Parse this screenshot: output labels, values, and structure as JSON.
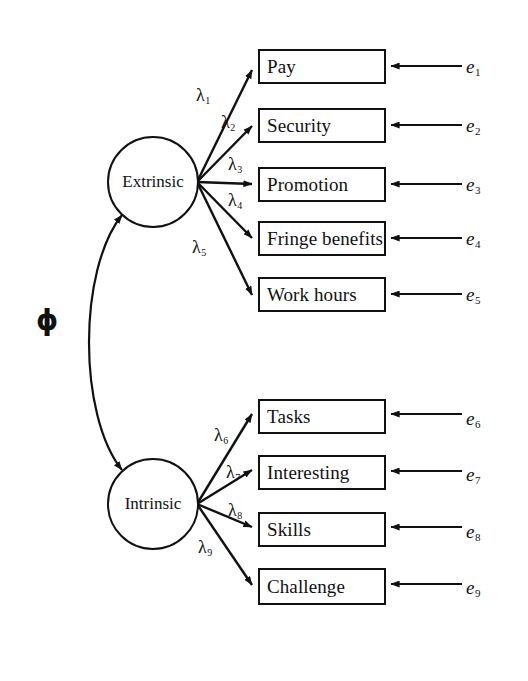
{
  "diagram": {
    "type": "sem-path-diagram",
    "background_color": "#ffffff",
    "stroke_color": "#111111",
    "latent_factors": [
      {
        "id": "extrinsic",
        "label": "Extrinsic",
        "cx": 153,
        "cy": 182,
        "r": 46
      },
      {
        "id": "intrinsic",
        "label": "Intrinsic",
        "cx": 153,
        "cy": 504,
        "r": 46
      }
    ],
    "indicators": [
      {
        "id": "pay",
        "label": "Pay",
        "x": 258,
        "y": 49,
        "w": 128,
        "h": 35,
        "factor": "extrinsic"
      },
      {
        "id": "security",
        "label": "Security",
        "x": 258,
        "y": 108,
        "w": 128,
        "h": 35,
        "factor": "extrinsic"
      },
      {
        "id": "promotion",
        "label": "Promotion",
        "x": 258,
        "y": 167,
        "w": 128,
        "h": 35,
        "factor": "extrinsic"
      },
      {
        "id": "fringe-benefits",
        "label": "Fringe benefits",
        "x": 258,
        "y": 221,
        "w": 128,
        "h": 35,
        "factor": "extrinsic"
      },
      {
        "id": "work-hours",
        "label": "Work hours",
        "x": 258,
        "y": 277,
        "w": 128,
        "h": 35,
        "factor": "extrinsic"
      },
      {
        "id": "tasks",
        "label": "Tasks",
        "x": 258,
        "y": 399,
        "w": 128,
        "h": 35,
        "factor": "intrinsic"
      },
      {
        "id": "interesting",
        "label": "Interesting",
        "x": 258,
        "y": 455,
        "w": 128,
        "h": 35,
        "factor": "intrinsic"
      },
      {
        "id": "skills",
        "label": "Skills",
        "x": 258,
        "y": 512,
        "w": 128,
        "h": 35,
        "factor": "intrinsic"
      },
      {
        "id": "challenge",
        "label": "Challenge",
        "x": 258,
        "y": 568,
        "w": 128,
        "h": 37,
        "factor": "intrinsic"
      }
    ],
    "errors": [
      {
        "id": "e1",
        "symbol": "e",
        "subscript": "1",
        "x": 466,
        "y": 56,
        "arrow_from_x": 462,
        "arrow_to_x": 391,
        "arrow_y": 66
      },
      {
        "id": "e2",
        "symbol": "e",
        "subscript": "2",
        "x": 466,
        "y": 115,
        "arrow_from_x": 462,
        "arrow_to_x": 391,
        "arrow_y": 125
      },
      {
        "id": "e3",
        "symbol": "e",
        "subscript": "3",
        "x": 466,
        "y": 174,
        "arrow_from_x": 462,
        "arrow_to_x": 391,
        "arrow_y": 184
      },
      {
        "id": "e4",
        "symbol": "e",
        "subscript": "4",
        "x": 466,
        "y": 228,
        "arrow_from_x": 462,
        "arrow_to_x": 391,
        "arrow_y": 238
      },
      {
        "id": "e5",
        "symbol": "e",
        "subscript": "5",
        "x": 466,
        "y": 284,
        "arrow_from_x": 462,
        "arrow_to_x": 391,
        "arrow_y": 294
      },
      {
        "id": "e6",
        "symbol": "e",
        "subscript": "6",
        "x": 466,
        "y": 408,
        "arrow_from_x": 462,
        "arrow_to_x": 391,
        "arrow_y": 414
      },
      {
        "id": "e7",
        "symbol": "e",
        "subscript": "7",
        "x": 466,
        "y": 464,
        "arrow_from_x": 462,
        "arrow_to_x": 391,
        "arrow_y": 471
      },
      {
        "id": "e8",
        "symbol": "e",
        "subscript": "8",
        "x": 466,
        "y": 521,
        "arrow_from_x": 462,
        "arrow_to_x": 391,
        "arrow_y": 527
      },
      {
        "id": "e9",
        "symbol": "e",
        "subscript": "9",
        "x": 466,
        "y": 577,
        "arrow_from_x": 462,
        "arrow_to_x": 391,
        "arrow_y": 584
      }
    ],
    "loadings": [
      {
        "id": "lambda1",
        "symbol": "λ",
        "subscript": "1",
        "label_x": 196,
        "label_y": 85,
        "from_x": 197,
        "from_y": 182,
        "to_x": 252,
        "to_y": 70
      },
      {
        "id": "lambda2",
        "symbol": "λ",
        "subscript": "2",
        "label_x": 221,
        "label_y": 112,
        "from_x": 197,
        "from_y": 182,
        "to_x": 252,
        "to_y": 126
      },
      {
        "id": "lambda3",
        "symbol": "λ",
        "subscript": "3",
        "label_x": 228,
        "label_y": 154,
        "from_x": 197,
        "from_y": 182,
        "to_x": 252,
        "to_y": 184
      },
      {
        "id": "lambda4",
        "symbol": "λ",
        "subscript": "4",
        "label_x": 228,
        "label_y": 190,
        "from_x": 197,
        "from_y": 182,
        "to_x": 252,
        "to_y": 238
      },
      {
        "id": "lambda5",
        "symbol": "λ",
        "subscript": "5",
        "label_x": 192,
        "label_y": 237,
        "from_x": 197,
        "from_y": 182,
        "to_x": 252,
        "to_y": 295
      },
      {
        "id": "lambda6",
        "symbol": "λ",
        "subscript": "6",
        "label_x": 214,
        "label_y": 425,
        "from_x": 197,
        "from_y": 504,
        "to_x": 252,
        "to_y": 414
      },
      {
        "id": "lambda7",
        "symbol": "λ",
        "subscript": "7",
        "label_x": 226,
        "label_y": 462,
        "from_x": 197,
        "from_y": 504,
        "to_x": 252,
        "to_y": 470
      },
      {
        "id": "lambda8",
        "symbol": "λ",
        "subscript": "8",
        "label_x": 228,
        "label_y": 500,
        "from_x": 197,
        "from_y": 504,
        "to_x": 252,
        "to_y": 527
      },
      {
        "id": "lambda9",
        "symbol": "λ",
        "subscript": "9",
        "label_x": 198,
        "label_y": 537,
        "from_x": 197,
        "from_y": 504,
        "to_x": 252,
        "to_y": 585
      }
    ],
    "covariance": {
      "id": "phi",
      "symbol": "ϕ",
      "label_x": 36,
      "label_y": 307,
      "path": "M 122 215 C 78 270, 78 415, 122 470",
      "double_headed": true
    }
  }
}
